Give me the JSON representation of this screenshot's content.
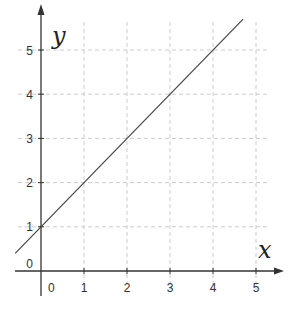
{
  "chart_data": {
    "type": "line",
    "title": "",
    "xlabel": "x",
    "ylabel": "y",
    "xlim": [
      -0.6,
      5.6
    ],
    "ylim": [
      -0.3,
      5.6
    ],
    "grid": true,
    "legend": null,
    "x_ticks": [
      "0",
      "1",
      "2",
      "3",
      "4",
      "5"
    ],
    "y_ticks": [
      "0",
      "1",
      "2",
      "3",
      "4",
      "5"
    ],
    "series": [
      {
        "name": "y = x + 1",
        "x": [
          -0.6,
          4.7
        ],
        "y": [
          0.4,
          5.7
        ]
      }
    ],
    "colors": {
      "line": "#444444",
      "axis": "#333333",
      "grid": "#cccccc"
    }
  }
}
